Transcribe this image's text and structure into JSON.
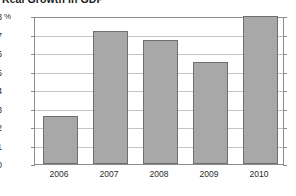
{
  "chart_data": {
    "type": "bar",
    "title": "Real Growth in GDP",
    "xlabel": "",
    "ylabel": "%",
    "categories": [
      "2006",
      "2007",
      "2008",
      "2009",
      "2010"
    ],
    "values": [
      2.6,
      7.2,
      6.7,
      5.5,
      8.0
    ],
    "ylim": [
      0,
      8
    ],
    "ytick_labels": [
      "0",
      "1",
      "2",
      "3",
      "4",
      "5",
      "6",
      "7",
      "8"
    ],
    "ytick_values": [
      0,
      1,
      2,
      3,
      4,
      5,
      6,
      7,
      8
    ],
    "grid": true,
    "legend": false,
    "legend_position": "none",
    "bar_color": "#a8a8a8",
    "bar_edge_color": "#6e6e6e",
    "grid_color": "#c4c4c4",
    "axis_color": "#8c8c8c",
    "text_color": "#2b2b2b"
  }
}
